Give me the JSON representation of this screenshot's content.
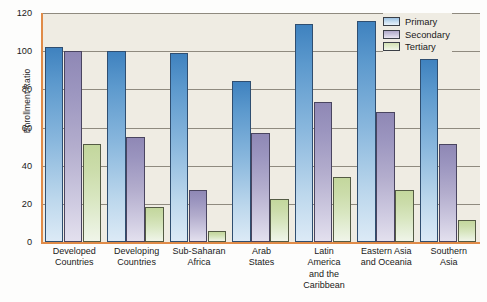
{
  "chart_data": {
    "type": "bar",
    "title": "",
    "xlabel": "",
    "ylabel": "Enrollment Ratio",
    "ylim": [
      0,
      120
    ],
    "yticks": [
      0,
      20,
      40,
      60,
      80,
      100,
      120
    ],
    "grid": true,
    "legend_position": "top-right",
    "categories": [
      "Developed Countries",
      "Developing Countries",
      "Sub-Saharan Africa",
      "Arab States",
      "Latin America and the Caribbean",
      "Eastern Asia and Oceania",
      "Southern Asia"
    ],
    "category_lines": [
      [
        "Developed",
        "Countries"
      ],
      [
        "Developing",
        "Countries"
      ],
      [
        "Sub-Saharan",
        "Africa"
      ],
      [
        "Arab",
        "States"
      ],
      [
        "Latin",
        "America",
        "and the",
        "Caribbean"
      ],
      [
        "Eastern Asia",
        "and Oceania"
      ],
      [
        "Southern",
        "Asia"
      ]
    ],
    "series": [
      {
        "name": "Primary",
        "color": "#5c99cd",
        "values": [
          102,
          100,
          99,
          84.5,
          114,
          116,
          96
        ]
      },
      {
        "name": "Secondary",
        "color": "#a59ec4",
        "values": [
          100,
          55,
          27,
          57,
          73.5,
          68,
          51.5
        ]
      },
      {
        "name": "Tertiary",
        "color": "#cbdcaa",
        "values": [
          51.5,
          18.5,
          6,
          22.5,
          34,
          27,
          11.5
        ]
      }
    ]
  },
  "legend": {
    "items": [
      {
        "label": "Primary",
        "key": "primary"
      },
      {
        "label": "Secondary",
        "key": "secondary"
      },
      {
        "label": "Tertiary",
        "key": "tertiary"
      }
    ]
  }
}
